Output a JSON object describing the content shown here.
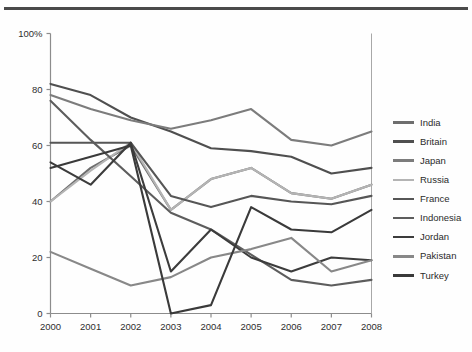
{
  "chart_data": {
    "type": "line",
    "title": "",
    "subtitle": "",
    "xlabel": "",
    "ylabel": "",
    "x": [
      2000,
      2001,
      2002,
      2003,
      2004,
      2005,
      2006,
      2007,
      2008
    ],
    "xtick_labels": [
      "2000",
      "2001",
      "2002",
      "2003",
      "2004",
      "2005",
      "2006",
      "2007",
      "2008"
    ],
    "ytick_labels": [
      "0",
      "20",
      "40",
      "60",
      "80",
      "100%"
    ],
    "ytick_values": [
      0,
      20,
      40,
      60,
      80,
      100
    ],
    "ylim": [
      0,
      100
    ],
    "xlim": [
      2000,
      2008
    ],
    "grid": false,
    "legend_position": "right",
    "series": [
      {
        "name": "India",
        "color": "#6e6e6e",
        "values": [
          40,
          52,
          60,
          37,
          48,
          52,
          43,
          41,
          46
        ]
      },
      {
        "name": "Britain",
        "color": "#4f4f4f",
        "values": [
          82,
          78,
          70,
          65,
          59,
          58,
          56,
          50,
          52
        ]
      },
      {
        "name": "Japan",
        "color": "#7c7c7c",
        "values": [
          78,
          73,
          69,
          66,
          69,
          73,
          62,
          60,
          65
        ]
      },
      {
        "name": "Russia",
        "color": "#b4b4b4",
        "values": [
          40,
          51,
          61,
          37,
          48,
          52,
          43,
          41,
          46
        ]
      },
      {
        "name": "France",
        "color": "#565656",
        "values": [
          61,
          61,
          61,
          42,
          38,
          42,
          40,
          39,
          42
        ]
      },
      {
        "name": "Indonesia",
        "color": "#5d5d5d",
        "values": [
          76,
          62,
          49,
          36,
          30,
          21,
          12,
          10,
          12
        ]
      },
      {
        "name": "Jordan",
        "color": "#3c3c3c",
        "values": [
          54,
          46,
          61,
          15,
          30,
          20,
          15,
          20,
          19
        ]
      },
      {
        "name": "Pakistan",
        "color": "#888888",
        "values": [
          22,
          16,
          10,
          13,
          20,
          23,
          27,
          15,
          19
        ]
      },
      {
        "name": "Turkey",
        "color": "#3a3a3a",
        "values": [
          52,
          56,
          60,
          0,
          3,
          38,
          30,
          29,
          37
        ]
      }
    ],
    "series_start_index": {
      "India": 0,
      "Britain": 0,
      "Japan": 0,
      "Russia": 0,
      "France": 0,
      "Indonesia": 0,
      "Jordan": 0,
      "Pakistan": 0,
      "Turkey": 0
    },
    "legend_entries": [
      "India",
      "Britain",
      "Japan",
      "Russia",
      "France",
      "Indonesia",
      "Jordan",
      "Pakistan",
      "Turkey"
    ]
  },
  "axes": {
    "y_labels": [
      "100%",
      "80",
      "60",
      "40",
      "20",
      "0"
    ],
    "x_labels": [
      "2000",
      "2001",
      "2002",
      "2003",
      "2004",
      "2005",
      "2006",
      "2007",
      "2008"
    ]
  },
  "colors": {
    "axis": "#8c8c8c",
    "text": "#2e2e2e",
    "rule": "#4a4a4a",
    "background": "#fefefe"
  }
}
